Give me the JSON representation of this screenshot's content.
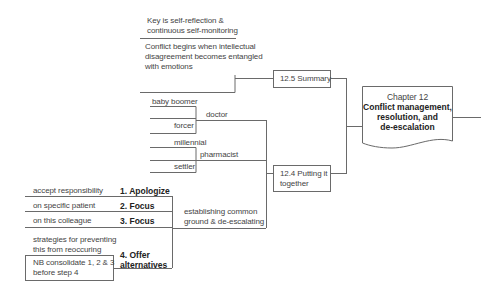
{
  "root": {
    "chapter": "Chapter 12",
    "title_line1": "Conflict management,",
    "title_line2": "resolution, and",
    "title_line3": "de-escalation"
  },
  "summary": {
    "label": "12.5 Summary",
    "children": [
      {
        "line1": "Key is self-reflection &",
        "line2": "continuous self-monitoring"
      },
      {
        "line1": "Conflict begins when intellectual",
        "line2": "disagreement becomes entangled",
        "line3": "with emotions"
      }
    ]
  },
  "putting_together": {
    "label_line1": "12.4 Putting it",
    "label_line2": "together",
    "branches": [
      {
        "label": "doctor",
        "children": [
          "baby boomer",
          "forcer"
        ]
      },
      {
        "label": "pharmacist",
        "children": [
          "millennial",
          "settler"
        ]
      },
      {
        "label_line1": "establishing common",
        "label_line2": "ground & de-escalating",
        "steps": [
          {
            "label": "1. Apologize",
            "detail": "accept responsibility"
          },
          {
            "label": "2. Focus",
            "detail": "on specific patient"
          },
          {
            "label": "3. Focus",
            "detail": "on this colleague"
          },
          {
            "label_line1": "4. Offer",
            "label_line2": "alternatives",
            "detail_line1": "strategies for preventing",
            "detail_line2": "this from reoccuring",
            "note_line1": "NB consolidate 1, 2 & 3",
            "note_line2": "before step 4"
          }
        ]
      }
    ]
  },
  "colors": {
    "line": "#6a6a6a",
    "text": "#444444",
    "bold_text": "#222222"
  }
}
